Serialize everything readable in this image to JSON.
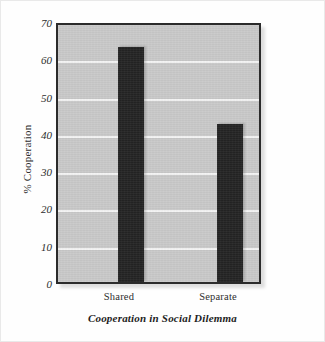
{
  "chart_data": {
    "type": "bar",
    "title": "Cooperation in Social Dilemma",
    "xlabel": "",
    "ylabel": "% Cooperation",
    "categories": [
      "Shared",
      "Separate"
    ],
    "values": [
      63,
      42.5
    ],
    "ylim": [
      0,
      70
    ],
    "yticks": [
      0,
      10,
      20,
      30,
      40,
      50,
      60,
      70
    ],
    "ytick_labels": [
      "0",
      "10",
      "20",
      "30",
      "40",
      "50",
      "60",
      "70"
    ],
    "grid": true,
    "grid_axis": "y",
    "legend": false,
    "series": [
      {
        "name": "% Cooperation",
        "values": [
          63,
          42.5
        ]
      }
    ],
    "colors": {
      "bar": "#232323",
      "plot_background": "#c9c9c9",
      "gridline": "#f4f4f4",
      "axis_border": "#2b2b2b",
      "text": "#2d2d2d",
      "page_background": "#fefefe"
    }
  }
}
